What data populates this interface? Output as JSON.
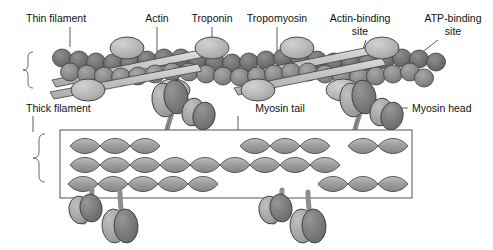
{
  "figure": {
    "background_color": "#ffffff",
    "width": 493,
    "height": 250
  },
  "labels": {
    "thin_filament": "Thin filament",
    "actin": "Actin",
    "troponin": "Troponin",
    "tropomyosin": "Tropomyosin",
    "actin_binding_site_line1": "Actin-binding",
    "actin_binding_site_line2": "site",
    "atp_binding_site_line1": "ATP-binding",
    "atp_binding_site_line2": "site",
    "thick_filament": "Thick filament",
    "myosin_tail": "Myosin tail",
    "myosin_head": "Myosin head"
  },
  "colors": {
    "actin_bead": "#8e8e8e",
    "actin_bead_dark": "#6f6f6f",
    "troponin": "#b9b9b9",
    "tropomyosin": "#c9c9c9",
    "myosin_head_light": "#a9a9a9",
    "myosin_head_dark": "#7d7d7d",
    "myosin_tail": "#9a9a9a",
    "outline": "#3d3d3d",
    "leader_line": "#4a4a4a",
    "label_text": "#111111",
    "box_border": "#555555"
  },
  "structures": {
    "thin_filament": {
      "name": "thin-filament",
      "description": "Double helix of actin beads wrapped by tropomyosin strands with troponin complexes",
      "actin_bead_count": 46,
      "troponin_count": 8,
      "tropomyosin_strand_count": 4
    },
    "thick_filament": {
      "name": "thick-filament",
      "description": "Bundle of coiled-coil myosin tails with projecting myosin heads",
      "coiled_coil_rows": 3,
      "myosin_head_count": 8,
      "box": {
        "x": 60,
        "y": 130,
        "width": 352,
        "height": 68
      }
    }
  }
}
